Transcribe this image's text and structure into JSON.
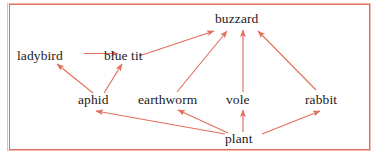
{
  "diagram": {
    "type": "food-web",
    "frame": {
      "border_color": "#e2705c",
      "background_color": "#ffffff"
    },
    "arrow_color": "#e2705c",
    "text_color": "#1b1b1b",
    "nodes": [
      {
        "id": "buzzard",
        "label": "buzzard",
        "x": 243,
        "y": 19,
        "trophic": "top-predator"
      },
      {
        "id": "ladybird",
        "label": "ladybird",
        "x": 47,
        "y": 57,
        "trophic": "predator"
      },
      {
        "id": "bluetit",
        "label": "blue tit",
        "x": 126,
        "y": 57,
        "trophic": "predator"
      },
      {
        "id": "aphid",
        "label": "aphid",
        "x": 99,
        "y": 100,
        "trophic": "herbivore"
      },
      {
        "id": "earthworm",
        "label": "earthworm",
        "x": 169,
        "y": 100,
        "trophic": "detritivore"
      },
      {
        "id": "vole",
        "label": "vole",
        "x": 243,
        "y": 100,
        "trophic": "herbivore"
      },
      {
        "id": "rabbit",
        "label": "rabbit",
        "x": 325,
        "y": 100,
        "trophic": "herbivore"
      },
      {
        "id": "plant",
        "label": "plant",
        "x": 243,
        "y": 139,
        "trophic": "producer"
      }
    ],
    "edges": [
      {
        "from": "ladybird",
        "to": "bluetit",
        "shape": "horizontal"
      },
      {
        "from": "aphid",
        "to": "ladybird",
        "shape": "diagonal"
      },
      {
        "from": "aphid",
        "to": "bluetit",
        "shape": "diagonal"
      },
      {
        "from": "bluetit",
        "to": "buzzard",
        "shape": "diagonal"
      },
      {
        "from": "earthworm",
        "to": "buzzard",
        "shape": "diagonal"
      },
      {
        "from": "vole",
        "to": "buzzard",
        "shape": "vertical"
      },
      {
        "from": "rabbit",
        "to": "buzzard",
        "shape": "diagonal"
      },
      {
        "from": "plant",
        "to": "aphid",
        "shape": "diagonal"
      },
      {
        "from": "plant",
        "to": "earthworm",
        "shape": "diagonal"
      },
      {
        "from": "plant",
        "to": "vole",
        "shape": "vertical"
      },
      {
        "from": "plant",
        "to": "rabbit",
        "shape": "diagonal"
      }
    ]
  }
}
